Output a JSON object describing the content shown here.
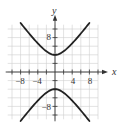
{
  "chart_data": {
    "type": "line",
    "title": "",
    "equation": "y^2/16 - x^2/9 = 1",
    "xlabel": "x",
    "ylabel": "y",
    "xlim": [
      -11,
      10
    ],
    "ylim": [
      -11,
      11
    ],
    "grid": true,
    "grid_step": 2,
    "x_tick_labels": [
      "-8",
      "-4",
      "4",
      "8"
    ],
    "x_tick_values": [
      -8,
      -4,
      4,
      8
    ],
    "y_tick_labels": [
      "8",
      "-8"
    ],
    "y_tick_values": [
      8,
      -8
    ],
    "series": [
      {
        "name": "upper branch",
        "x": [
          -8,
          -6,
          -4,
          -2,
          0,
          2,
          4,
          6,
          8
        ],
        "y": [
          11.4,
          8.94,
          6.67,
          4.81,
          4,
          4.81,
          6.67,
          8.94,
          11.4
        ]
      },
      {
        "name": "lower branch",
        "x": [
          -8,
          -6,
          -4,
          -2,
          0,
          2,
          4,
          6,
          8
        ],
        "y": [
          -11.4,
          -8.94,
          -6.67,
          -4.81,
          -4,
          -4.81,
          -6.67,
          -8.94,
          -11.4
        ]
      }
    ],
    "colors": {
      "curve": "#222222",
      "axis": "#333333",
      "grid": "#cfcfcf"
    }
  },
  "labels": {
    "x_axis": "x",
    "y_axis": "y",
    "x_ticks": [
      "−8",
      "−4",
      "4",
      "8"
    ],
    "y_tick_pos": "8",
    "y_tick_neg": "−8"
  }
}
